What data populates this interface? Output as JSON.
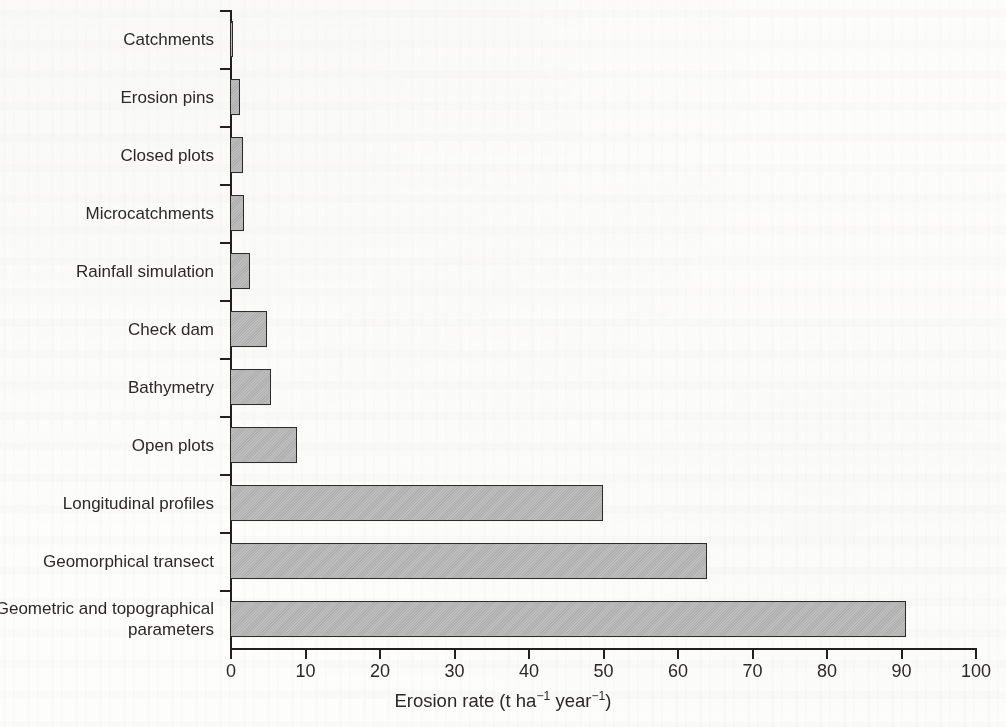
{
  "chart_data": {
    "type": "bar",
    "orientation": "horizontal",
    "title": "",
    "xlabel": "Erosion rate (t ha⁻¹ year⁻¹)",
    "ylabel": "",
    "xlim": [
      0,
      100
    ],
    "xticks": [
      0,
      10,
      20,
      30,
      40,
      50,
      60,
      70,
      80,
      90,
      100
    ],
    "xtick_labels": [
      "0",
      "10",
      "20",
      "30",
      "40",
      "50",
      "60",
      "70",
      "80",
      "90",
      "100"
    ],
    "grid": false,
    "legend": null,
    "bar_fill_color": "#b4b4b4",
    "bar_edge_color": "#2c2a28",
    "axis_color": "#231f20",
    "background_color": "#fdfdfc",
    "categories": [
      "Catchments",
      "Erosion pins",
      "Closed plots",
      "Microcatchments",
      "Rainfall simulation",
      "Check dam",
      "Bathymetry",
      "Open plots",
      "Longitudinal profiles",
      "Geomorphical transect",
      "Geometric and topographical\nparameters"
    ],
    "values": [
      0.4,
      1.3,
      1.8,
      1.9,
      2.7,
      4.9,
      5.5,
      9.0,
      50.0,
      64.0,
      90.7
    ]
  },
  "axis_title_parts": {
    "lead": "Erosion rate (t ha",
    "sup1": "−1",
    "mid": " year",
    "sup2": "−1",
    "tail": ")"
  }
}
